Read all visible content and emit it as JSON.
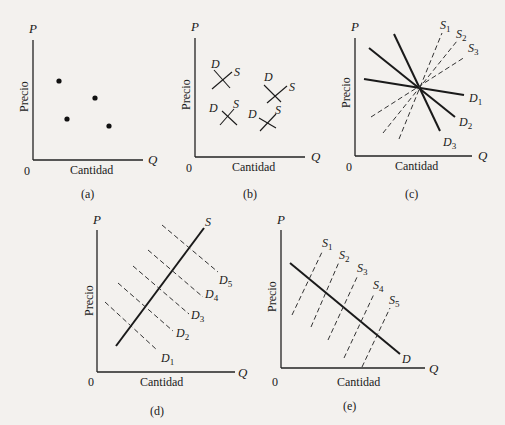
{
  "figure": {
    "axis_labels": {
      "y": "P",
      "x": "Q",
      "origin": "0",
      "y_title": "Precio",
      "x_title": "Cantidad"
    },
    "panels": [
      {
        "id": "a",
        "caption": "(a)",
        "description": "scatter of four price-quantity observations"
      },
      {
        "id": "b",
        "caption": "(b)",
        "description": "four small crossing D and S curve pairs",
        "curve_labels": [
          "D",
          "S"
        ]
      },
      {
        "id": "c",
        "caption": "(c)",
        "description": "three demand curves and three supply curves through one point",
        "demand_labels": [
          "D1",
          "D2",
          "D3"
        ],
        "supply_labels": [
          "S1",
          "S2",
          "S3"
        ]
      },
      {
        "id": "d",
        "caption": "(d)",
        "description": "one fixed supply curve S with five shifting demand curves",
        "supply_label": "S",
        "demand_labels": [
          "D1",
          "D2",
          "D3",
          "D4",
          "D5"
        ]
      },
      {
        "id": "e",
        "caption": "(e)",
        "description": "one fixed demand curve D with five shifting supply curves",
        "demand_label": "D",
        "supply_labels": [
          "S1",
          "S2",
          "S3",
          "S4",
          "S5"
        ]
      }
    ]
  }
}
